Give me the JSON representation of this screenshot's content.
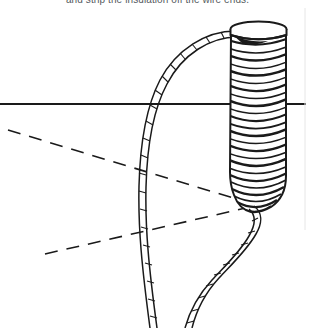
{
  "figure": {
    "caption": "and strip the insulation off the wire ends.",
    "width": 315,
    "height": 328,
    "background_color": "#ffffff",
    "ink_color": "#1a1a1a",
    "caption_color": "#555a5e",
    "style": "line-art technical illustration"
  },
  "elements": {
    "coil": {
      "label": "wire coil",
      "left": 228,
      "right": 287,
      "top": 22,
      "bottom": 212,
      "turn_count": 26,
      "cap_label": "coil top cap",
      "cap_top": 22,
      "cap_bottom": 36
    },
    "horizon_line": {
      "label": "horizontal reference line",
      "y": 104,
      "x_start": 0,
      "x_end": 306,
      "stroke_width": 2
    },
    "dashed_upper": {
      "label": "upper dashed construction line",
      "x_start": 8,
      "y_start": 130,
      "x_end": 250,
      "y_end": 203,
      "dash_pattern": "13 9"
    },
    "dashed_lower": {
      "label": "lower dashed construction line",
      "x_start": 45,
      "y_start": 254,
      "x_end": 250,
      "y_end": 207,
      "dash_pattern": "13 9"
    },
    "lead_wire_upper": {
      "label": "upper lead wire",
      "description": "twisted wire curving from coil top down to lower left",
      "start_x": 236,
      "start_y": 30,
      "end_x": 150,
      "end_y": 328
    },
    "lead_wire_lower": {
      "label": "lower lead wire",
      "description": "twisted wire leaving coil base curving to lower left",
      "start_x": 252,
      "start_y": 205,
      "end_x": 200,
      "end_y": 328
    }
  }
}
